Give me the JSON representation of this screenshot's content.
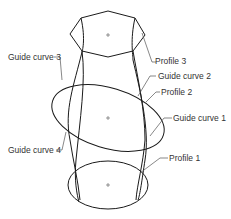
{
  "diagram": {
    "type": "loft-with-guide-curves",
    "labels": {
      "profile_3": "Profile 3",
      "profile_2": "Profile 2",
      "profile_1": "Profile 1",
      "guide_curve_1": "Guide curve 1",
      "guide_curve_2": "Guide curve 2",
      "guide_curve_3": "Guide curve 3",
      "guide_curve_4": "Guide curve 4"
    },
    "colors": {
      "stroke": "#1a1a1a",
      "leader": "#555555",
      "text": "#333333"
    }
  }
}
